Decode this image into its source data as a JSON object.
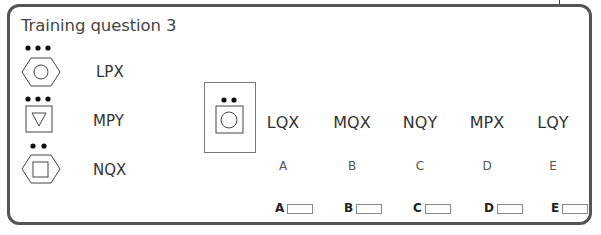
{
  "title": "Training question 3",
  "examples": [
    {
      "code": "LPX",
      "dots": 3,
      "outer": "hexagon",
      "inner": "circle"
    },
    {
      "code": "MPY",
      "dots": 3,
      "outer": "square",
      "inner": "triangle-down"
    },
    {
      "code": "NQX",
      "dots": 2,
      "outer": "hexagon",
      "inner": "square"
    }
  ],
  "target": {
    "dots": 2,
    "outer": "square",
    "inner": "circle"
  },
  "options": [
    {
      "code": "LQX",
      "letter": "A"
    },
    {
      "code": "MQX",
      "letter": "B"
    },
    {
      "code": "NQY",
      "letter": "C"
    },
    {
      "code": "MPX",
      "letter": "D"
    },
    {
      "code": "LQY",
      "letter": "E"
    }
  ],
  "answers": [
    {
      "label": "A"
    },
    {
      "label": "B"
    },
    {
      "label": "C"
    },
    {
      "label": "D"
    },
    {
      "label": "E"
    }
  ]
}
